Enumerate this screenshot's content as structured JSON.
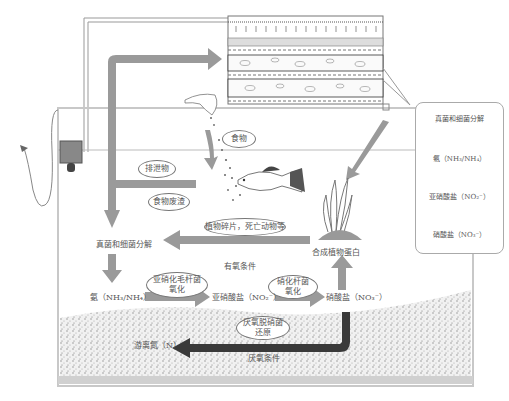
{
  "diagram": {
    "tank": {
      "aerobic_label": "有氧条件",
      "anaerobic_label": "厌氧条件"
    },
    "bubbles": {
      "food": "食物",
      "waste": "排泄物",
      "leftover_food": "食物废渣",
      "plant_debris": "植物碎片，死亡动物等",
      "nitrosomonas": "亚硝化毛杆菌\n氧化",
      "nitrobacter": "硝化杆菌\n氧化",
      "denitrifying": "厌氧脱硝菌\n还原"
    },
    "nodes": {
      "decomposition": "真菌和细菌分解",
      "ammonia": "氨（NH₃/NH₄）",
      "nitrite": "亚硝酸盐（NO₂⁻）",
      "nitrate": "硝酸盐（NO₃⁻）",
      "plant_protein": "合成植物蛋白",
      "free_nitrogen": "游离氮（N）"
    },
    "filter_detail": {
      "steps": [
        "真菌和细菌分解",
        "氨（NH₃/NH₄）",
        "亚硝酸盐（NO₂⁻）",
        "硝酸盐（NO₃⁻）"
      ]
    },
    "colors": {
      "arrow_gray": "#9a9a9a",
      "arrow_dark": "#3a3a3a",
      "gravel": "#cfcfcf",
      "tank_border": "#c8c8c8"
    }
  }
}
